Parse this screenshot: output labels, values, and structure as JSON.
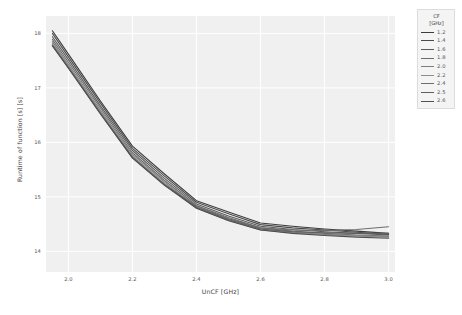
{
  "chart_data": {
    "type": "line",
    "title": "",
    "xlabel": "UnCF [GHz]",
    "ylabel": "Runtime of function [s] [s]",
    "xlim": [
      1.93,
      3.02
    ],
    "ylim": [
      13.62,
      18.32
    ],
    "xticks": [
      "2.0",
      "2.2",
      "2.4",
      "2.6",
      "2.8",
      "3.0"
    ],
    "xtick_values": [
      2.0,
      2.2,
      2.4,
      2.6,
      2.8,
      3.0
    ],
    "yticks": [
      "14",
      "15",
      "16",
      "17",
      "18"
    ],
    "ytick_values": [
      14,
      15,
      16,
      17,
      18
    ],
    "grid": true,
    "legend_position": "outside-top-right",
    "legend_title": "CF\n[GHz]",
    "legend_title_line1": "CF",
    "legend_title_line2": "[GHz]",
    "x": [
      1.95,
      2.0,
      2.1,
      2.2,
      2.3,
      2.4,
      2.5,
      2.6,
      2.7,
      2.8,
      2.9,
      3.0
    ],
    "series": [
      {
        "name": "1.2",
        "color": "#3c3c3c",
        "values": [
          18.05,
          17.62,
          16.76,
          15.93,
          15.42,
          14.93,
          14.72,
          14.52,
          14.46,
          14.41,
          14.37,
          14.33
        ]
      },
      {
        "name": "1.4",
        "color": "#4a4a4a",
        "values": [
          18.0,
          17.57,
          16.72,
          15.89,
          15.38,
          14.9,
          14.69,
          14.49,
          14.43,
          14.39,
          14.35,
          14.31
        ]
      },
      {
        "name": "1.6",
        "color": "#5a5a5a",
        "values": [
          17.94,
          17.52,
          16.67,
          15.85,
          15.34,
          14.87,
          14.65,
          14.46,
          14.4,
          14.36,
          14.33,
          14.3
        ]
      },
      {
        "name": "1.8",
        "color": "#6b6b6b",
        "values": [
          17.89,
          17.47,
          16.63,
          15.81,
          15.3,
          14.84,
          14.62,
          14.43,
          14.37,
          14.33,
          14.3,
          14.28
        ]
      },
      {
        "name": "2.0",
        "color": "#7d7d7d",
        "values": [
          17.85,
          17.43,
          16.59,
          15.78,
          15.27,
          14.81,
          14.59,
          14.41,
          14.35,
          14.31,
          14.29,
          14.27
        ]
      },
      {
        "name": "2.2",
        "color": "#8c8c8c",
        "values": [
          17.82,
          17.4,
          16.56,
          15.75,
          15.24,
          14.79,
          14.57,
          14.39,
          14.34,
          14.3,
          14.28,
          14.26
        ]
      },
      {
        "name": "2.4",
        "color": "#6e6e6e",
        "values": [
          17.79,
          17.38,
          16.54,
          15.73,
          15.23,
          14.83,
          14.6,
          14.43,
          14.39,
          14.38,
          14.4,
          14.45
        ]
      },
      {
        "name": "2.5",
        "color": "#5f5f5f",
        "values": [
          17.78,
          17.37,
          16.53,
          15.72,
          15.22,
          14.81,
          14.58,
          14.41,
          14.36,
          14.34,
          14.33,
          14.33
        ]
      },
      {
        "name": "2.6",
        "color": "#4f4f4f",
        "values": [
          17.77,
          17.36,
          16.52,
          15.71,
          15.21,
          14.79,
          14.56,
          14.39,
          14.33,
          14.29,
          14.26,
          14.24
        ]
      }
    ]
  }
}
